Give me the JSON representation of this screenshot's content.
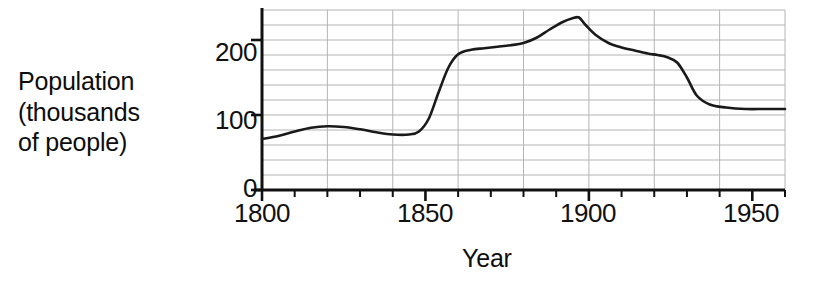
{
  "chart_data": {
    "type": "line",
    "title": "",
    "xlabel": "Year",
    "ylabel": "Population (thousands of people)",
    "ylabel_lines": [
      "Population",
      "(thousands",
      "of people)"
    ],
    "xlim": [
      1800,
      1960
    ],
    "ylim": [
      0,
      240
    ],
    "grid": true,
    "legend_position": "none",
    "x_major_ticks": [
      1800,
      1850,
      1900,
      1950
    ],
    "x_major_tick_labels": [
      "1800",
      "1850",
      "1900",
      "1950"
    ],
    "x_minor_tick_step": 10,
    "y_major_ticks": [
      0,
      100,
      200
    ],
    "y_major_tick_labels": [
      "0",
      "100",
      "200"
    ],
    "y_gridline_step": 20,
    "line_color": "#1a1a1a",
    "grid_color": "#b4b4b4",
    "axis_color": "#111111",
    "series": [
      {
        "name": "Population",
        "x": [
          1800,
          1805,
          1810,
          1815,
          1820,
          1825,
          1830,
          1835,
          1840,
          1845,
          1848,
          1851,
          1854,
          1857,
          1860,
          1864,
          1868,
          1872,
          1876,
          1880,
          1884,
          1888,
          1892,
          1895,
          1897,
          1899,
          1902,
          1906,
          1910,
          1914,
          1918,
          1921,
          1924,
          1927,
          1930,
          1933,
          1937,
          1942,
          1948,
          1954,
          1960
        ],
        "y": [
          68,
          72,
          78,
          83,
          85,
          84,
          81,
          77,
          74,
          74,
          78,
          95,
          130,
          163,
          181,
          187,
          189,
          191,
          193,
          196,
          203,
          214,
          224,
          229,
          230,
          220,
          207,
          196,
          190,
          186,
          182,
          180,
          177,
          170,
          150,
          126,
          114,
          110,
          108,
          108,
          108
        ]
      }
    ]
  },
  "geometry": {
    "plot_left": 262,
    "plot_right": 785,
    "plot_top": 10,
    "y_zero": 190,
    "px_per_unit_y": 0.68,
    "px_per_year_x": 3.27
  }
}
